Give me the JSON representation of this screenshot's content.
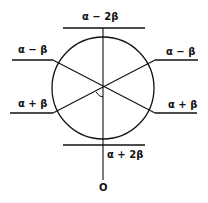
{
  "diagram": {
    "type": "frost-circle",
    "levels": [
      {
        "id": "top",
        "label": "α − 2β"
      },
      {
        "id": "upper-left",
        "label": "α − β"
      },
      {
        "id": "upper-right",
        "label": "α − β"
      },
      {
        "id": "lower-left",
        "label": "α + β"
      },
      {
        "id": "lower-right",
        "label": "α + β"
      },
      {
        "id": "bottom",
        "label": "α + 2β"
      }
    ],
    "axis_origin_label": "O",
    "colors": {
      "line": "#111111",
      "background": "#ffffff"
    }
  }
}
